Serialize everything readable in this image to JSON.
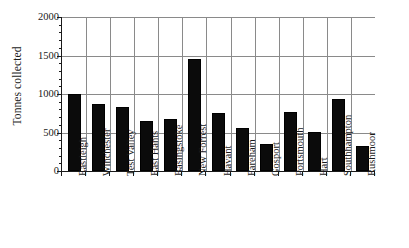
{
  "chart_data": {
    "type": "bar",
    "title": "",
    "xlabel": "",
    "ylabel": "Tonnes collected",
    "ylim": [
      0,
      2000
    ],
    "yticks": [
      0,
      500,
      1000,
      1500,
      2000
    ],
    "ytick_labels": [
      "0",
      "500",
      "1000",
      "1500",
      "2000"
    ],
    "grid": "horizontal-and-vertical",
    "legend": "none",
    "bar_color": "#0b0b0b",
    "grid_color": "#8a8a8a",
    "axis_color": "#1a1a1a",
    "categories": [
      "Eastleigh",
      "Winchester",
      "Test Valley",
      "East Hants",
      "Basingstoke",
      "New Forrest",
      "Havant",
      "Fareham",
      "Gosport",
      "Portsmouth",
      "Hart",
      "Southhampton",
      "Rushmoor"
    ],
    "values": [
      1000,
      875,
      830,
      650,
      670,
      1450,
      750,
      555,
      350,
      770,
      505,
      940,
      320
    ]
  }
}
